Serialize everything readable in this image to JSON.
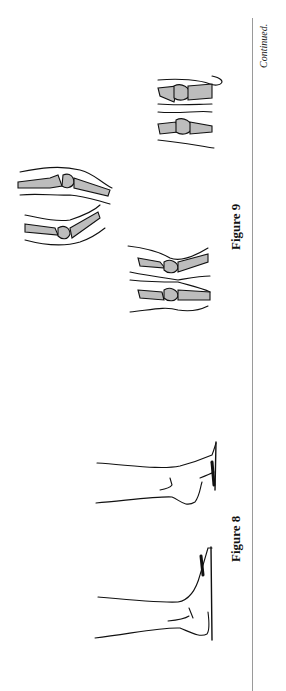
{
  "page": {
    "orientation": "rotated-90-ccw",
    "continued_label": "Continued."
  },
  "figures": [
    {
      "id": "figure-8",
      "caption": "Figure 8",
      "description": "Two line drawings of a foot/ankle against a vertical wall"
    },
    {
      "id": "figure-9",
      "caption": "Figure 9",
      "description": "Three pairs of knee joint drawings with shaded bones"
    }
  ],
  "colors": {
    "bone_fill": "#bdbdbd",
    "rule": "#9a9a9a",
    "ink": "#111111"
  }
}
